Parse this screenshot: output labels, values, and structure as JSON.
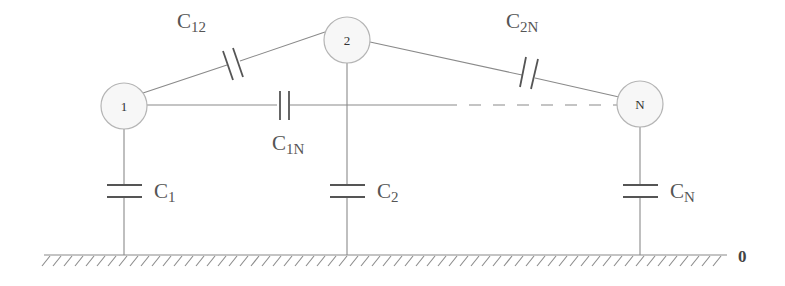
{
  "diagram": {
    "type": "capacitance-network",
    "nodes": [
      {
        "id": "1",
        "label": "1",
        "cx": 124,
        "cy": 106
      },
      {
        "id": "2",
        "label": "2",
        "cx": 347,
        "cy": 40
      },
      {
        "id": "N",
        "label": "N",
        "cx": 640,
        "cy": 104
      }
    ],
    "mutual_capacitors": [
      {
        "name": "C12",
        "base": "C",
        "sub": "12",
        "from": "1",
        "to": "2"
      },
      {
        "name": "C1N",
        "base": "C",
        "sub": "1N",
        "from": "1",
        "to": "N"
      },
      {
        "name": "C2N",
        "base": "C",
        "sub": "2N",
        "from": "2",
        "to": "N"
      }
    ],
    "ground_capacitors": [
      {
        "name": "C1",
        "base": "C",
        "sub": "1",
        "node": "1"
      },
      {
        "name": "C2",
        "base": "C",
        "sub": "2",
        "node": "2"
      },
      {
        "name": "CN",
        "base": "C",
        "sub": "N",
        "node": "N"
      }
    ],
    "ground": {
      "label": "0"
    },
    "connection_1N": {
      "style": "solid then dashed"
    }
  }
}
